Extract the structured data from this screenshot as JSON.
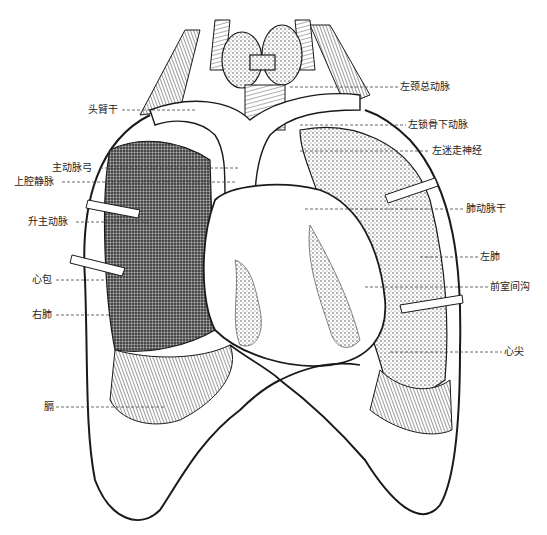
{
  "figure": {
    "line_color": "#1a1a1a",
    "background": "#ffffff"
  },
  "labels_left": [
    {
      "id": "brachiocephalic-trunk",
      "text": "头臂干",
      "x": 88,
      "y": 104,
      "line_to": 195
    },
    {
      "id": "aortic-arch",
      "text": "主动脉弓",
      "x": 52,
      "y": 162,
      "line_to": 240
    },
    {
      "id": "superior-vena-cava",
      "text": "上腔静脉",
      "x": 14,
      "y": 176,
      "line_to": 235
    },
    {
      "id": "ascending-aorta",
      "text": "升主动脉",
      "x": 28,
      "y": 216,
      "line_to": 150
    },
    {
      "id": "pericardium",
      "text": "心包",
      "x": 32,
      "y": 274,
      "line_to": 115
    },
    {
      "id": "right-lung",
      "text": "右肺",
      "x": 32,
      "y": 309,
      "line_to": 110
    },
    {
      "id": "diaphragm",
      "text": "膈",
      "x": 44,
      "y": 401,
      "line_to": 165
    }
  ],
  "labels_right": [
    {
      "id": "left-common-carotid",
      "text": "左颈总动脉",
      "x": 400,
      "y": 81,
      "line_from": 290
    },
    {
      "id": "left-subclavian",
      "text": "左锁骨下动脉",
      "x": 408,
      "y": 119,
      "line_from": 300
    },
    {
      "id": "left-vagus",
      "text": "左迷走神经",
      "x": 432,
      "y": 145,
      "line_from": 300
    },
    {
      "id": "pulmonary-trunk",
      "text": "肺动脉干",
      "x": 466,
      "y": 203,
      "line_from": 305
    },
    {
      "id": "left-lung",
      "text": "左肺",
      "x": 480,
      "y": 251,
      "line_from": 420
    },
    {
      "id": "anterior-interventricular-sulcus",
      "text": "前室间沟",
      "x": 490,
      "y": 281,
      "line_from": 365
    },
    {
      "id": "apex",
      "text": "心尖",
      "x": 504,
      "y": 346,
      "line_from": 390
    }
  ]
}
